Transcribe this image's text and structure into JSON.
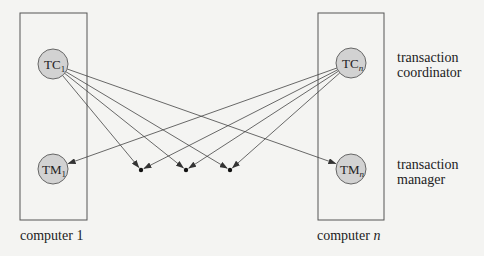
{
  "diagram": {
    "type": "distributed-transaction-system",
    "colors": {
      "background": "#f4f4f2",
      "box_stroke": "#555555",
      "node_fill": "#d2d2d2",
      "node_stroke": "#666666",
      "line": "#444444",
      "text": "#222222"
    },
    "computers": [
      {
        "id": "computer-1",
        "label_prefix": "computer ",
        "label_suffix": "1",
        "box": {
          "x": 20,
          "y": 13,
          "w": 67,
          "h": 207
        },
        "coordinator": {
          "id": "TC1",
          "main": "TC",
          "sub": "1",
          "cx": 53,
          "cy": 64,
          "r": 15
        },
        "manager": {
          "id": "TM1",
          "main": "TM",
          "sub": "1",
          "cx": 53,
          "cy": 169,
          "r": 15
        }
      },
      {
        "id": "computer-n",
        "label_prefix": "computer ",
        "label_suffix": "n",
        "box": {
          "x": 318,
          "y": 13,
          "w": 66,
          "h": 207
        },
        "coordinator": {
          "id": "TCn",
          "main": "TC",
          "sub": "n",
          "cx": 351,
          "cy": 63,
          "r": 15
        },
        "manager": {
          "id": "TMn",
          "main": "TM",
          "sub": "n",
          "cx": 351,
          "cy": 169,
          "r": 15
        }
      }
    ],
    "intermediate_sites": [
      {
        "id": "site-a",
        "x": 141,
        "y": 170
      },
      {
        "id": "site-b",
        "x": 186,
        "y": 170
      },
      {
        "id": "site-c",
        "x": 230,
        "y": 170
      }
    ],
    "edges": [
      {
        "from": "TC1",
        "to": "TMn"
      },
      {
        "from": "TC1",
        "to": "site-a"
      },
      {
        "from": "TC1",
        "to": "site-b"
      },
      {
        "from": "TC1",
        "to": "site-c"
      },
      {
        "from": "TCn",
        "to": "TM1"
      },
      {
        "from": "TCn",
        "to": "site-a"
      },
      {
        "from": "TCn",
        "to": "site-b"
      },
      {
        "from": "TCn",
        "to": "site-c"
      }
    ],
    "side_labels": {
      "coordinator": {
        "line1": "transaction",
        "line2": "coordinator"
      },
      "manager": {
        "line1": "transaction",
        "line2": "manager"
      }
    }
  }
}
